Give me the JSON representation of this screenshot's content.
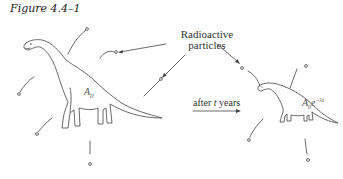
{
  "figure": {
    "caption": "Figure 4.4–1",
    "label_particles_line1": "Radioactive",
    "label_particles_line2": "particles",
    "arrow_label_prefix": "after ",
    "arrow_label_var": "t",
    "arrow_label_suffix": " years",
    "initial_amount_symbol": "A",
    "initial_amount_sub": "0",
    "decayed_amount_base": "A",
    "decayed_amount_sub": "0",
    "decayed_amount_e": "e",
    "decayed_amount_exp": "−λt"
  },
  "colors": {
    "ink": "#444444",
    "background": "#ffffff"
  }
}
